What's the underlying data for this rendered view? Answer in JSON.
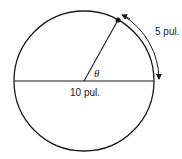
{
  "diagram": {
    "type": "circle-arc-geometry",
    "labels": {
      "arc_length": "5 pul.",
      "diameter": "10 pul.",
      "angle": "θ"
    },
    "colors": {
      "stroke": "#1a1a1a",
      "background": "#ffffff"
    },
    "elements": [
      {
        "kind": "circle",
        "description": "circle with diameter 10 pul."
      },
      {
        "kind": "diameter",
        "description": "horizontal diameter line",
        "label": "10 pul."
      },
      {
        "kind": "radius",
        "description": "radius from center to point on circle forming angle θ with diameter"
      },
      {
        "kind": "point",
        "description": "dot on circumference at end of radius"
      },
      {
        "kind": "arc-arrow",
        "description": "double-headed curved arrow along arc from point to diameter end",
        "label": "5 pul."
      },
      {
        "kind": "angle-label",
        "label": "θ"
      }
    ]
  }
}
